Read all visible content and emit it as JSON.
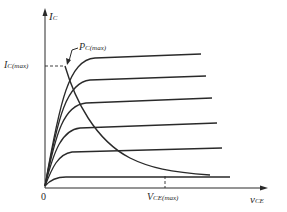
{
  "diagram": {
    "axes": {
      "y_label": "I",
      "y_label_sub": "C",
      "x_label": "v",
      "x_label_sub": "CE",
      "origin_label": "0"
    },
    "annotations": {
      "ic_max_main": "I",
      "ic_max_sub": "C(max)",
      "pc_max_main": "P",
      "pc_max_sub": "C(max)",
      "vce_max_main": "V",
      "vce_max_sub": "CE(max)"
    },
    "colors": {
      "line": "#2a2a2a",
      "background": "#ffffff"
    },
    "curves_count": 6
  }
}
